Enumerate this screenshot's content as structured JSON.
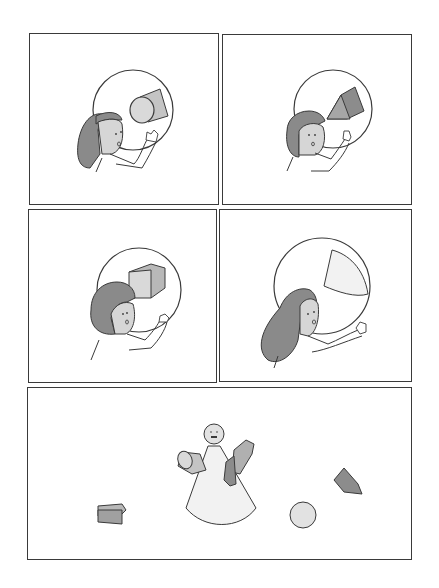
{
  "comic": {
    "type": "five-panel wordless comic",
    "panels": [
      {
        "id": 1,
        "description": "Girl with long hair peers through a circular lens at a cylinder",
        "object": "cylinder"
      },
      {
        "id": 2,
        "description": "Girl with short hair peers through a circular lens at a triangular prism",
        "object": "triangular-prism"
      },
      {
        "id": 3,
        "description": "Girl with bob hair peers through a circular lens at a cube",
        "object": "cube"
      },
      {
        "id": 4,
        "description": "Girl with long hair peers through a circular lens at a cone section",
        "object": "cone"
      },
      {
        "id": 5,
        "description": "Figure made of a cone and sphere head holding a cylinder and a prism; a box, a sphere and a triangular prism scattered around",
        "objects": [
          "cone-figure",
          "cylinder",
          "triangular-prism",
          "box",
          "sphere",
          "triangular-prism"
        ]
      }
    ]
  },
  "colors": {
    "line": "#3a3a3a",
    "hair": "#8a8a8a",
    "skin": "#d6d6d6",
    "shape_light": "#d9d9d9",
    "shape_mid": "#b8b8b8",
    "shape_dark": "#8c8c8c",
    "cone_fill": "#f2f2f2"
  }
}
